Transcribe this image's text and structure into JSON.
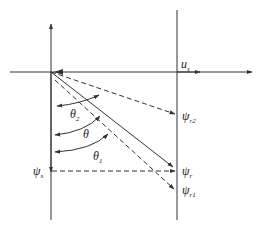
{
  "diagram": {
    "type": "vector-phasor-diagram",
    "colors": {
      "line": "#333333",
      "background": "#ffffff"
    },
    "labels": {
      "us": {
        "main": "u",
        "sub": "s"
      },
      "psi_r2": {
        "main": "ψ",
        "sub": "r2"
      },
      "psi_r": {
        "main": "ψ",
        "sub": "r"
      },
      "psi_r1": {
        "main": "ψ",
        "sub": "r1"
      },
      "psi_s": {
        "main": "ψ",
        "sub": "s"
      },
      "theta2": {
        "main": "θ",
        "sub": "2"
      },
      "theta": {
        "main": "θ",
        "sub": ""
      },
      "theta1": {
        "main": "θ",
        "sub": "1"
      }
    }
  }
}
